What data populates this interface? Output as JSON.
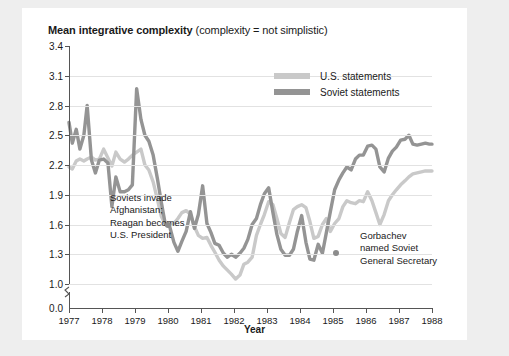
{
  "title": {
    "bold": "Mean integrative complexity",
    "rest": " (complexity = not simplistic)"
  },
  "axes": {
    "x_title": "Year",
    "y_ticks": [
      "3.4",
      "3.1",
      "2.8",
      "2.5",
      "2.2",
      "1.9",
      "1.6",
      "1.3",
      "1.0",
      "0.0"
    ],
    "x_ticks": [
      "1977",
      "1978",
      "1979",
      "1980",
      "1981",
      "1982",
      "1983",
      "1984",
      "1985",
      "1986",
      "1987",
      "1988"
    ]
  },
  "legend": {
    "items": [
      {
        "label": "U.S. statements",
        "color": "#c9c9c9"
      },
      {
        "label": "Soviet statements",
        "color": "#949494"
      }
    ]
  },
  "annotations": [
    {
      "id": "soviets-invade",
      "lines": [
        "Soviets invade",
        "Afghanistan;",
        "Reagan becomes",
        "U.S. President"
      ],
      "marker_year": 1980.0,
      "marker_value": 1.6
    },
    {
      "id": "gorbachev",
      "lines": [
        "Gorbachev",
        "named Soviet",
        "General Secretary"
      ],
      "marker_year": 1985.1,
      "marker_value": 1.31
    }
  ],
  "chart_data": {
    "type": "line",
    "title": "Mean integrative complexity (complexity = not simplistic)",
    "xlabel": "Year",
    "ylabel": "",
    "xlim": [
      1977,
      1988
    ],
    "ylim": [
      1.0,
      3.4
    ],
    "y_axis_break_below": 1.0,
    "grid": true,
    "legend_position": "top-right",
    "x": [
      1977.0,
      1977.1,
      1977.22,
      1977.33,
      1977.45,
      1977.55,
      1977.68,
      1977.8,
      1977.92,
      1978.05,
      1978.18,
      1978.3,
      1978.42,
      1978.55,
      1978.68,
      1978.8,
      1978.92,
      1979.05,
      1979.18,
      1979.3,
      1979.42,
      1979.55,
      1979.68,
      1979.8,
      1979.92,
      1980.05,
      1980.18,
      1980.3,
      1980.42,
      1980.55,
      1980.68,
      1980.8,
      1980.92,
      1981.05,
      1981.18,
      1981.3,
      1981.42,
      1981.55,
      1981.68,
      1981.8,
      1981.92,
      1982.05,
      1982.18,
      1982.3,
      1982.42,
      1982.55,
      1982.68,
      1982.8,
      1982.92,
      1983.05,
      1983.18,
      1983.3,
      1983.42,
      1983.55,
      1983.68,
      1983.8,
      1983.92,
      1984.05,
      1984.18,
      1984.3,
      1984.42,
      1984.55,
      1984.68,
      1984.8,
      1984.92,
      1985.05,
      1985.18,
      1985.3,
      1985.42,
      1985.55,
      1985.68,
      1985.8,
      1985.92,
      1986.05,
      1986.18,
      1986.3,
      1986.42,
      1986.55,
      1986.68,
      1986.8,
      1986.92,
      1987.05,
      1987.18,
      1987.3,
      1987.42,
      1987.55,
      1987.68,
      1987.8,
      1987.92,
      1988.0
    ],
    "series": [
      {
        "name": "Soviet statements",
        "color": "#949494",
        "values": [
          2.63,
          2.42,
          2.56,
          2.36,
          2.5,
          2.8,
          2.25,
          2.12,
          2.25,
          2.26,
          2.22,
          1.78,
          2.08,
          1.93,
          1.93,
          1.95,
          2.0,
          2.97,
          2.66,
          2.5,
          2.44,
          2.3,
          2.06,
          1.82,
          1.6,
          1.58,
          1.42,
          1.33,
          1.43,
          1.53,
          1.73,
          1.56,
          1.7,
          1.99,
          1.61,
          1.52,
          1.41,
          1.39,
          1.31,
          1.27,
          1.3,
          1.27,
          1.31,
          1.36,
          1.45,
          1.6,
          1.66,
          1.8,
          1.91,
          1.97,
          1.72,
          1.5,
          1.35,
          1.29,
          1.29,
          1.35,
          1.53,
          1.69,
          1.42,
          1.25,
          1.24,
          1.4,
          1.31,
          1.52,
          1.73,
          1.95,
          2.05,
          2.12,
          2.18,
          2.15,
          2.26,
          2.3,
          2.3,
          2.39,
          2.4,
          2.36,
          2.18,
          2.13,
          2.27,
          2.34,
          2.38,
          2.45,
          2.46,
          2.5,
          2.41,
          2.4,
          2.41,
          2.42,
          2.41,
          2.41
        ]
      },
      {
        "name": "U.S. statements",
        "color": "#c9c9c9",
        "values": [
          2.18,
          2.16,
          2.24,
          2.26,
          2.24,
          2.26,
          2.28,
          2.25,
          2.26,
          2.36,
          2.27,
          2.19,
          2.33,
          2.26,
          2.23,
          2.26,
          2.3,
          2.33,
          2.36,
          2.2,
          2.15,
          2.03,
          1.85,
          1.68,
          1.6,
          1.6,
          1.61,
          1.66,
          1.72,
          1.74,
          1.7,
          1.58,
          1.49,
          1.46,
          1.47,
          1.39,
          1.32,
          1.24,
          1.18,
          1.14,
          1.1,
          1.05,
          1.09,
          1.2,
          1.22,
          1.27,
          1.49,
          1.6,
          1.7,
          1.83,
          1.8,
          1.66,
          1.51,
          1.47,
          1.62,
          1.75,
          1.78,
          1.8,
          1.77,
          1.63,
          1.46,
          1.48,
          1.6,
          1.66,
          1.53,
          1.61,
          1.66,
          1.78,
          1.84,
          1.82,
          1.81,
          1.84,
          1.83,
          1.93,
          1.84,
          1.72,
          1.6,
          1.7,
          1.84,
          1.9,
          1.95,
          2.0,
          2.04,
          2.08,
          2.11,
          2.12,
          2.13,
          2.14,
          2.14,
          2.14
        ]
      }
    ]
  }
}
